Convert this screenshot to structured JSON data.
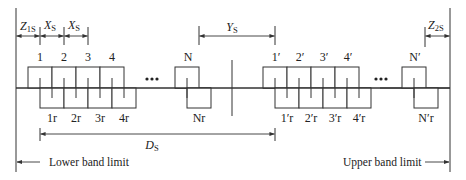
{
  "diagram": {
    "title": "",
    "dimensions": {
      "z1s": {
        "main": "Z",
        "sub": "1S"
      },
      "xs1": {
        "main": "X",
        "sub": "S"
      },
      "xs2": {
        "main": "X",
        "sub": "S"
      },
      "ys": {
        "main": "Y",
        "sub": "S"
      },
      "z2s": {
        "main": "Z",
        "sub": "2S"
      },
      "ds": {
        "main": "D",
        "sub": "S"
      }
    },
    "lower_band": {
      "transmit_labels": [
        "1",
        "2",
        "3",
        "4",
        "N"
      ],
      "receive_labels": [
        "1r",
        "2r",
        "3r",
        "4r",
        "Nr"
      ],
      "ellipsis": "•••"
    },
    "upper_band": {
      "transmit_labels": [
        "1′",
        "2′",
        "3′",
        "4′",
        "N′"
      ],
      "receive_labels": [
        "1′r",
        "2′r",
        "3′r",
        "4′r",
        "N′r"
      ],
      "ellipsis": "•••"
    },
    "band_limits": {
      "lower": "Lower band limit",
      "upper": "Upper band limit"
    },
    "colors": {
      "line": "#333333",
      "text": "#222222",
      "background": "#ffffff"
    }
  }
}
